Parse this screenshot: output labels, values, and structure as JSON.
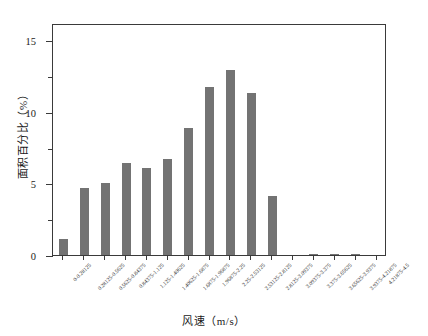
{
  "chart_data": {
    "type": "bar",
    "title": "",
    "xlabel": "风速（m/s）",
    "ylabel": "面积百分比（%）",
    "ylim": [
      0,
      16.2
    ],
    "ytick_labels": [
      "0",
      "5",
      "10",
      "15"
    ],
    "ytick_values": [
      0,
      5,
      10,
      15
    ],
    "yminor_values": [
      2.5,
      7.5,
      12.5
    ],
    "grid": false,
    "legend": null,
    "bar_color": "#737373",
    "axis_color": "#3a3a3a",
    "bin_width": 0.28125,
    "categories": [
      "0-0.28125",
      "0.28125-0.5625",
      "0.5625-0.84375",
      "0.84375-1.125",
      "1.125-1.40625",
      "1.40625-1.6875",
      "1.6875-1.96875",
      "1.96875-2.25",
      "2.25-2.53125",
      "2.53125-2.8125",
      "2.8125-3.09375",
      "3.09375-3.375",
      "3.375-3.65625",
      "3.65625-3.9375",
      "3.9375-4.21875",
      "4.21875-4.5"
    ],
    "values": [
      1.1,
      4.7,
      5.0,
      6.4,
      6.1,
      6.7,
      8.9,
      11.7,
      12.9,
      11.3,
      4.1,
      0.0,
      0.1,
      0.1,
      0.05,
      0.0
    ]
  }
}
